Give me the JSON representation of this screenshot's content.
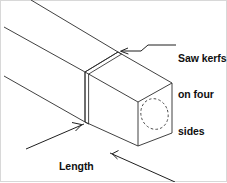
{
  "figure": {
    "type": "technical-line-drawing",
    "width": 227,
    "height": 182,
    "background_color": "#ffffff",
    "line_color": "#2b2b2b",
    "border_color": "#d8d8d8"
  },
  "callouts": {
    "saw_kerfs": {
      "name": "saw-kerfs-callout",
      "line1": "Saw kerfs",
      "line2": "on four",
      "line3": "sides"
    },
    "length_of_tenon": {
      "name": "length-of-tenon-callout",
      "line1": "Length",
      "line2": "of tenon"
    }
  },
  "parts": {
    "board": "wooden board shown in isometric projection",
    "tenon_block": "square tenon end block",
    "kerf_top": "saw kerf on top face",
    "kerf_front": "saw kerf on front face",
    "hidden_circle": "dashed ellipse indicating hidden round feature on end grain"
  }
}
